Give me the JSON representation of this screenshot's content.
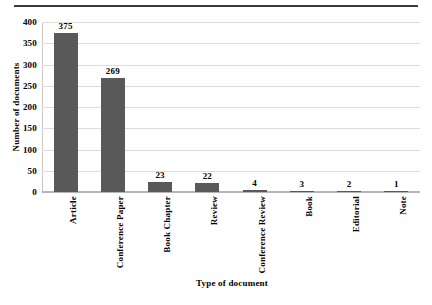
{
  "chart_data": {
    "type": "bar",
    "title": "",
    "xlabel": "Type of document",
    "ylabel": "Number of documents",
    "categories": [
      "Article",
      "Conference Paper",
      "Book Chapter",
      "Review",
      "Conference Review",
      "Book",
      "Editorial",
      "Note"
    ],
    "values": [
      375,
      269,
      23,
      22,
      4,
      3,
      2,
      1
    ],
    "data_labels": [
      "375",
      "269",
      "23",
      "22",
      "4",
      "3",
      "2",
      "1"
    ],
    "ylim": [
      0,
      400
    ],
    "yticks": [
      0,
      50,
      100,
      150,
      200,
      250,
      300,
      350,
      400
    ],
    "ytick_labels": [
      "0",
      "50",
      "100",
      "150",
      "200",
      "250",
      "300",
      "350",
      "400"
    ],
    "grid": true,
    "grid_axis": "y",
    "legend": false,
    "legend_position": "none",
    "bar_color": "#595959",
    "grid_color": "#dddddd",
    "axis_color": "#b5b5b5",
    "text_color": "#000000"
  }
}
